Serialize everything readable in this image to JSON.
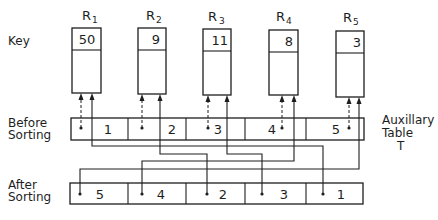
{
  "labels": {
    "key": "Key",
    "before_line1": "Before",
    "before_line2": "Sorting",
    "after_line1": "After",
    "after_line2": "Sorting",
    "aux_line1": "Auxillary",
    "aux_line2": "Table",
    "aux_line3": "T"
  },
  "records": [
    {
      "name": "R",
      "sub": "1",
      "key": "50"
    },
    {
      "name": "R",
      "sub": "2",
      "key": "9"
    },
    {
      "name": "R",
      "sub": "3",
      "key": "11"
    },
    {
      "name": "R",
      "sub": "4",
      "key": "8"
    },
    {
      "name": "R",
      "sub": "5",
      "key": "3"
    }
  ],
  "before_sorting": [
    "1",
    "2",
    "3",
    "4",
    "5"
  ],
  "after_sorting": [
    "5",
    "4",
    "2",
    "3",
    "1"
  ],
  "colors": {
    "line": "#1e1e1e",
    "background": "#ffffff"
  }
}
